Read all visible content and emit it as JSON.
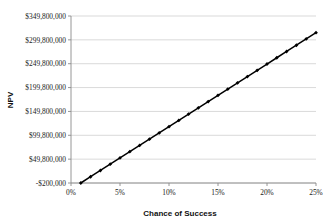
{
  "chart_data": {
    "type": "line",
    "title": "",
    "xlabel": "Chance of Success",
    "ylabel": "NPV",
    "xlim": [
      0,
      25
    ],
    "ylim": [
      -200000,
      349800000
    ],
    "grid": true,
    "legend": false,
    "marker": "diamond",
    "line_color": "#000000",
    "grid_color": "#c9c9c9",
    "axis_color": "#8a8a8a",
    "xtick_values": [
      0,
      5,
      10,
      15,
      20,
      25
    ],
    "xtick_labels": [
      "0%",
      "5%",
      "10%",
      "15%",
      "20%",
      "25%"
    ],
    "ytick_values": [
      -200000,
      49800000,
      99800000,
      149800000,
      199800000,
      249800000,
      299800000,
      349800000
    ],
    "ytick_labels": [
      "-$200,000",
      "$49,800,000",
      "$99,800,000",
      "$149,800,000",
      "$199,800,000",
      "$249,800,000",
      "$299,800,000",
      "$349,800,000"
    ],
    "x": [
      1,
      2,
      3,
      4,
      5,
      6,
      7,
      8,
      9,
      10,
      11,
      12,
      13,
      14,
      15,
      16,
      17,
      18,
      19,
      20,
      21,
      22,
      23,
      24,
      25
    ],
    "values": [
      -200000,
      12925000,
      26050000,
      39175000,
      52300000,
      65425000,
      78550000,
      91675000,
      104800000,
      117925000,
      131050000,
      144175000,
      157300000,
      170425000,
      183550000,
      196675000,
      209800000,
      222925000,
      236050000,
      249175000,
      262300000,
      275425000,
      288550000,
      301675000,
      314800000
    ],
    "series_name": "NPV"
  },
  "axis": {
    "x_title": "Chance of Success",
    "y_title": "NPV"
  }
}
